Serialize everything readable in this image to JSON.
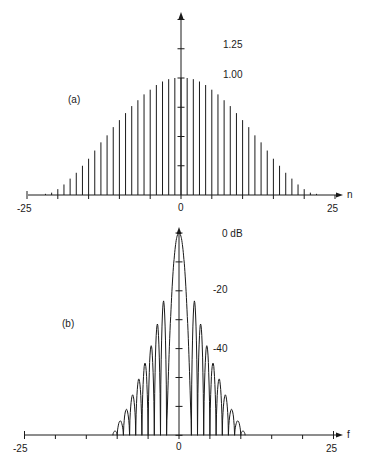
{
  "chart_data": [
    {
      "type": "stem",
      "panel_label": "(a)",
      "title": "",
      "xlabel": "n",
      "ylabel": "",
      "x_tick_labels": [
        "-25",
        "0",
        "25"
      ],
      "x_ticks": [
        -25,
        -20,
        -15,
        -10,
        -5,
        0,
        5,
        10,
        15,
        20,
        25
      ],
      "y_tick_labels": [
        "1.25",
        "1.00"
      ],
      "y_ticks": [
        0.25,
        0.5,
        0.75,
        1.0,
        1.25,
        1.5
      ],
      "xlim": [
        -25,
        25
      ],
      "ylim": [
        0,
        1.55
      ],
      "grid": false,
      "n": [
        -22,
        -21,
        -20,
        -19,
        -18,
        -17,
        -16,
        -15,
        -14,
        -13,
        -12,
        -11,
        -10,
        -9,
        -8,
        -7,
        -6,
        -5,
        -4,
        -3,
        -2,
        -1,
        0,
        1,
        2,
        3,
        4,
        5,
        6,
        7,
        8,
        9,
        10,
        11,
        12,
        13,
        14,
        15,
        16,
        17,
        18,
        19,
        20,
        21,
        22
      ],
      "values": [
        0.01,
        0.02,
        0.05,
        0.09,
        0.14,
        0.19,
        0.25,
        0.31,
        0.38,
        0.45,
        0.51,
        0.58,
        0.64,
        0.7,
        0.76,
        0.81,
        0.86,
        0.9,
        0.94,
        0.97,
        0.99,
        1.0,
        1.0,
        1.0,
        0.99,
        0.97,
        0.94,
        0.9,
        0.86,
        0.81,
        0.76,
        0.7,
        0.64,
        0.58,
        0.51,
        0.45,
        0.38,
        0.31,
        0.25,
        0.19,
        0.14,
        0.09,
        0.05,
        0.02,
        0.01
      ]
    },
    {
      "type": "line",
      "panel_label": "(b)",
      "title": "",
      "xlabel": "f",
      "ylabel": "",
      "x_tick_labels": [
        "-25",
        "0",
        "25"
      ],
      "x_ticks": [
        -25,
        -20,
        -15,
        -10,
        -5,
        0,
        5,
        10,
        15,
        20,
        25
      ],
      "y_tick_labels": [
        "0 dB",
        "-20",
        "-40"
      ],
      "y_ticks_db": [
        0,
        -10,
        -20,
        -30,
        -40,
        -50,
        -60,
        -70
      ],
      "xlim": [
        -25,
        25
      ],
      "ylim_db": [
        -70,
        0
      ],
      "grid": false,
      "mainlobe_halfwidth": 2,
      "sidelobe_peaks": [
        {
          "f": 2.5,
          "db": -23.5
        },
        {
          "f": 3.5,
          "db": -31.5
        },
        {
          "f": 4.5,
          "db": -39
        },
        {
          "f": 5.5,
          "db": -45
        },
        {
          "f": 6.5,
          "db": -50.5
        },
        {
          "f": 7.5,
          "db": -56
        },
        {
          "f": 8.5,
          "db": -61
        },
        {
          "f": 9.5,
          "db": -65
        },
        {
          "f": 10,
          "db": -68.5
        }
      ]
    }
  ],
  "labels": {
    "panel_a": "(a)",
    "panel_b": "(b)",
    "a_y_125": "1.25",
    "a_y_100": "1.00",
    "a_x_min": "-25",
    "a_x_zero": "0",
    "a_x_max": "25",
    "a_x_axis": "n",
    "b_y_0": "0 dB",
    "b_y_20": "-20",
    "b_y_40": "-40",
    "b_x_min": "-25",
    "b_x_zero": "0",
    "b_x_max": "25",
    "b_x_axis": "f"
  }
}
